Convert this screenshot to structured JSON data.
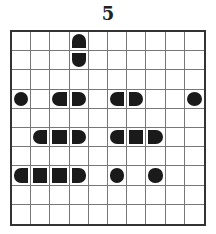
{
  "title": "5",
  "grid": {
    "rows": 10,
    "cols": 10,
    "segments": [
      {
        "row": 0,
        "col": 3,
        "shape": "top"
      },
      {
        "row": 1,
        "col": 3,
        "shape": "bottom"
      },
      {
        "row": 3,
        "col": 0,
        "shape": "circle"
      },
      {
        "row": 3,
        "col": 2,
        "shape": "left"
      },
      {
        "row": 3,
        "col": 3,
        "shape": "right"
      },
      {
        "row": 3,
        "col": 5,
        "shape": "left"
      },
      {
        "row": 3,
        "col": 6,
        "shape": "right"
      },
      {
        "row": 3,
        "col": 9,
        "shape": "circle"
      },
      {
        "row": 5,
        "col": 1,
        "shape": "left"
      },
      {
        "row": 5,
        "col": 2,
        "shape": "middle"
      },
      {
        "row": 5,
        "col": 3,
        "shape": "right"
      },
      {
        "row": 5,
        "col": 5,
        "shape": "left"
      },
      {
        "row": 5,
        "col": 6,
        "shape": "middle"
      },
      {
        "row": 5,
        "col": 7,
        "shape": "right"
      },
      {
        "row": 7,
        "col": 0,
        "shape": "left"
      },
      {
        "row": 7,
        "col": 1,
        "shape": "middle"
      },
      {
        "row": 7,
        "col": 2,
        "shape": "middle"
      },
      {
        "row": 7,
        "col": 3,
        "shape": "right"
      },
      {
        "row": 7,
        "col": 5,
        "shape": "circle"
      },
      {
        "row": 7,
        "col": 7,
        "shape": "circle"
      }
    ]
  },
  "colors": {
    "ship": "#1a1a1a",
    "grid_line": "#777777",
    "border": "#333333"
  }
}
